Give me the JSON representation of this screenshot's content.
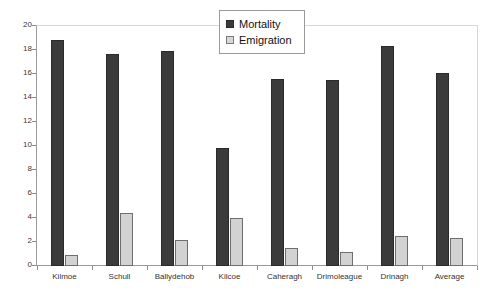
{
  "chart_data": {
    "type": "bar",
    "title": "",
    "subtitle": "",
    "xlabel": "",
    "ylabel": "",
    "ylim": [
      0,
      20
    ],
    "ytick_step": 2,
    "yticks": [
      20,
      18,
      16,
      14,
      12,
      10,
      8,
      6,
      4,
      2,
      0
    ],
    "grid": false,
    "legend_position": "top-right",
    "categories": [
      "Kilmoe",
      "Schull",
      "Ballydehob",
      "Kilcoe",
      "Caheragh",
      "Drimoleague",
      "Drinagh",
      "Average"
    ],
    "series": [
      {
        "name": "Mortality",
        "color": "#3b3b3b",
        "values": [
          18.8,
          17.7,
          17.9,
          9.8,
          15.6,
          15.5,
          18.3,
          16.1
        ]
      },
      {
        "name": "Emigration",
        "color": "#d2d2d2",
        "values": [
          0.9,
          4.4,
          2.2,
          4.0,
          1.5,
          1.2,
          2.5,
          2.3
        ]
      }
    ]
  },
  "legend": {
    "items": [
      {
        "label": "Mortality",
        "swatch": "filled-dark-square-icon"
      },
      {
        "label": "Emigration",
        "swatch": "filled-light-square-icon"
      }
    ]
  }
}
